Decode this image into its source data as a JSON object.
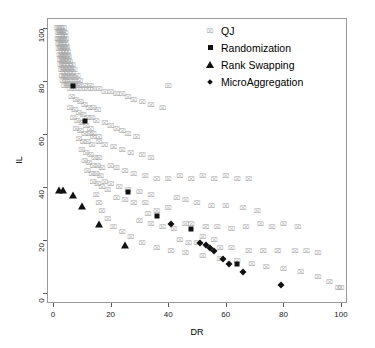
{
  "chart_data": {
    "type": "scatter",
    "title": "",
    "xlabel": "DR",
    "ylabel": "IL",
    "xlim": [
      0,
      100
    ],
    "ylim": [
      0,
      100
    ],
    "xticks": [
      0,
      20,
      40,
      60,
      80,
      100
    ],
    "yticks": [
      0,
      20,
      40,
      60,
      80,
      100
    ],
    "grid": false,
    "legend_position": "top-right",
    "series": [
      {
        "name": "QJ",
        "marker": "cross-box",
        "color": "#a8a8a8",
        "points": [
          [
            1.5,
            100
          ],
          [
            2.0,
            100
          ],
          [
            2.4,
            99
          ],
          [
            2.8,
            100
          ],
          [
            3.2,
            99
          ],
          [
            3.6,
            100
          ],
          [
            1.8,
            98
          ],
          [
            2.2,
            98
          ],
          [
            2.6,
            98
          ],
          [
            3.0,
            97
          ],
          [
            3.4,
            98
          ],
          [
            3.8,
            97
          ],
          [
            4.2,
            98
          ],
          [
            1.6,
            96
          ],
          [
            2.0,
            96
          ],
          [
            2.5,
            96
          ],
          [
            3.0,
            95
          ],
          [
            3.5,
            96
          ],
          [
            4.0,
            95
          ],
          [
            4.4,
            96
          ],
          [
            1.9,
            94
          ],
          [
            2.3,
            94
          ],
          [
            2.8,
            93
          ],
          [
            3.3,
            94
          ],
          [
            3.8,
            93
          ],
          [
            4.3,
            94
          ],
          [
            4.8,
            93
          ],
          [
            2.1,
            92
          ],
          [
            2.6,
            92
          ],
          [
            3.1,
            91
          ],
          [
            3.6,
            92
          ],
          [
            4.1,
            91
          ],
          [
            4.6,
            92
          ],
          [
            5.1,
            91
          ],
          [
            2.3,
            90
          ],
          [
            2.8,
            90
          ],
          [
            3.3,
            89
          ],
          [
            3.8,
            90
          ],
          [
            4.3,
            89
          ],
          [
            4.9,
            90
          ],
          [
            5.4,
            89
          ],
          [
            2.5,
            88
          ],
          [
            3.0,
            88
          ],
          [
            3.5,
            87
          ],
          [
            4.0,
            88
          ],
          [
            4.6,
            87
          ],
          [
            5.2,
            88
          ],
          [
            5.8,
            87
          ],
          [
            2.7,
            86
          ],
          [
            3.2,
            86
          ],
          [
            3.8,
            85
          ],
          [
            4.4,
            86
          ],
          [
            5.0,
            85
          ],
          [
            5.6,
            86
          ],
          [
            6.2,
            85
          ],
          [
            6.8,
            86
          ],
          [
            2.9,
            84
          ],
          [
            3.5,
            84
          ],
          [
            4.1,
            83
          ],
          [
            4.7,
            84
          ],
          [
            5.3,
            83
          ],
          [
            6.0,
            84
          ],
          [
            6.7,
            83
          ],
          [
            7.4,
            84
          ],
          [
            3.1,
            82
          ],
          [
            3.8,
            82
          ],
          [
            4.5,
            81
          ],
          [
            5.2,
            82
          ],
          [
            6.0,
            81
          ],
          [
            6.8,
            82
          ],
          [
            7.6,
            81
          ],
          [
            8.4,
            82
          ],
          [
            3.4,
            80
          ],
          [
            4.2,
            80
          ],
          [
            5.0,
            79
          ],
          [
            5.8,
            80
          ],
          [
            6.6,
            79
          ],
          [
            7.5,
            80
          ],
          [
            8.4,
            79
          ],
          [
            9.3,
            80
          ],
          [
            4.0,
            78
          ],
          [
            5.0,
            78
          ],
          [
            6.0,
            77
          ],
          [
            7.0,
            78
          ],
          [
            8.0,
            77
          ],
          [
            9.0,
            78
          ],
          [
            10.0,
            77
          ],
          [
            11.0,
            78
          ],
          [
            12.0,
            77
          ],
          [
            13.0,
            78
          ],
          [
            14.0,
            77
          ],
          [
            16.0,
            77
          ],
          [
            18.0,
            76
          ],
          [
            20.0,
            76
          ],
          [
            22.0,
            75
          ],
          [
            24.0,
            75
          ],
          [
            26.0,
            74
          ],
          [
            28.0,
            73
          ],
          [
            31.0,
            72
          ],
          [
            34.0,
            71
          ],
          [
            38.0,
            70
          ],
          [
            40.0,
            78
          ],
          [
            6.5,
            74
          ],
          [
            8.0,
            73
          ],
          [
            9.5,
            72
          ],
          [
            11.0,
            71
          ],
          [
            12.5,
            70
          ],
          [
            14.0,
            70
          ],
          [
            15.5,
            69
          ],
          [
            6.0,
            70
          ],
          [
            7.5,
            69
          ],
          [
            9.0,
            68
          ],
          [
            10.5,
            67
          ],
          [
            12.0,
            66
          ],
          [
            13.5,
            66
          ],
          [
            15.0,
            65
          ],
          [
            7.0,
            66
          ],
          [
            8.5,
            65
          ],
          [
            10.0,
            64
          ],
          [
            11.5,
            63
          ],
          [
            13.0,
            62
          ],
          [
            8.0,
            62
          ],
          [
            9.5,
            61
          ],
          [
            11.0,
            60
          ],
          [
            12.5,
            60
          ],
          [
            14.0,
            59
          ],
          [
            9.0,
            58
          ],
          [
            10.5,
            57
          ],
          [
            12.0,
            57
          ],
          [
            13.5,
            56
          ],
          [
            18.0,
            64
          ],
          [
            20.0,
            63
          ],
          [
            22.0,
            62
          ],
          [
            24.0,
            61
          ],
          [
            26.0,
            60
          ],
          [
            29.0,
            59
          ],
          [
            16.0,
            57
          ],
          [
            18.0,
            56
          ],
          [
            21.0,
            55
          ],
          [
            24.0,
            54
          ],
          [
            27.0,
            53
          ],
          [
            31.0,
            52
          ],
          [
            34.0,
            51
          ],
          [
            10.0,
            54
          ],
          [
            11.5,
            53
          ],
          [
            13.0,
            52
          ],
          [
            14.5,
            51
          ],
          [
            16.0,
            51
          ],
          [
            11.0,
            50
          ],
          [
            12.5,
            49
          ],
          [
            14.0,
            48
          ],
          [
            15.5,
            48
          ],
          [
            17.0,
            47
          ],
          [
            12.0,
            46
          ],
          [
            13.5,
            45
          ],
          [
            15.0,
            45
          ],
          [
            16.5,
            44
          ],
          [
            20.0,
            48
          ],
          [
            22.0,
            47
          ],
          [
            25.0,
            46
          ],
          [
            28.0,
            45
          ],
          [
            32.0,
            44
          ],
          [
            36.0,
            43
          ],
          [
            40.0,
            43
          ],
          [
            44.0,
            44
          ],
          [
            48.0,
            43
          ],
          [
            52.0,
            44
          ],
          [
            56.0,
            43
          ],
          [
            60.0,
            44
          ],
          [
            64.0,
            43
          ],
          [
            68.0,
            43
          ],
          [
            18.0,
            42
          ],
          [
            20.0,
            41
          ],
          [
            23.0,
            40
          ],
          [
            26.0,
            39
          ],
          [
            30.0,
            38
          ],
          [
            34.0,
            37
          ],
          [
            14.0,
            42
          ],
          [
            15.5,
            41
          ],
          [
            17.0,
            40
          ],
          [
            19.0,
            39
          ],
          [
            43.0,
            36
          ],
          [
            46.0,
            35
          ],
          [
            50.0,
            34
          ],
          [
            55.0,
            33
          ],
          [
            60.0,
            33
          ],
          [
            66.0,
            32
          ],
          [
            71.0,
            31
          ],
          [
            40.0,
            32
          ],
          [
            36.0,
            31
          ],
          [
            33.0,
            30
          ],
          [
            46.0,
            26
          ],
          [
            48.0,
            26
          ],
          [
            53.0,
            25
          ],
          [
            57.0,
            25
          ],
          [
            62.0,
            24
          ],
          [
            67.0,
            25
          ],
          [
            72.0,
            26
          ],
          [
            76.0,
            25
          ],
          [
            80.0,
            26
          ],
          [
            85.0,
            25
          ],
          [
            30.0,
            27
          ],
          [
            34.0,
            26
          ],
          [
            38.0,
            25
          ],
          [
            42.0,
            24
          ],
          [
            52.0,
            21
          ],
          [
            56.0,
            20
          ],
          [
            44.0,
            20
          ],
          [
            47.0,
            19
          ],
          [
            50.0,
            19
          ],
          [
            58.0,
            17
          ],
          [
            62.0,
            17
          ],
          [
            68.0,
            16
          ],
          [
            73.0,
            16
          ],
          [
            78.0,
            16
          ],
          [
            84.0,
            16
          ],
          [
            88.0,
            16
          ],
          [
            92.0,
            15
          ],
          [
            74.0,
            10
          ],
          [
            80.0,
            9
          ],
          [
            86.0,
            8
          ],
          [
            92.0,
            6
          ],
          [
            96.0,
            4
          ],
          [
            99.0,
            2
          ],
          [
            100.0,
            2
          ],
          [
            64.0,
            12
          ],
          [
            69.0,
            11
          ],
          [
            58.0,
            13
          ],
          [
            52.0,
            14
          ],
          [
            46.0,
            15
          ],
          [
            41.0,
            16
          ],
          [
            36.0,
            17
          ],
          [
            31.0,
            19
          ],
          [
            27.0,
            21
          ],
          [
            24.0,
            23
          ],
          [
            21.0,
            25
          ],
          [
            19.0,
            28
          ],
          [
            17.0,
            31
          ],
          [
            16.0,
            34
          ],
          [
            15.0,
            37
          ],
          [
            22.0,
            36
          ],
          [
            25.0,
            35
          ],
          [
            28.0,
            34
          ],
          [
            32.0,
            34
          ],
          [
            14.0,
            60
          ],
          [
            16.0,
            59
          ]
        ]
      },
      {
        "name": "Randomization",
        "marker": "square",
        "color": "#111111",
        "points": [
          [
            7,
            78
          ],
          [
            11,
            65
          ],
          [
            26,
            38
          ],
          [
            36,
            29
          ],
          [
            48,
            24
          ],
          [
            64,
            11
          ]
        ]
      },
      {
        "name": "Rank Swapping",
        "marker": "triangle",
        "color": "#111111",
        "points": [
          [
            2,
            39
          ],
          [
            3.5,
            39
          ],
          [
            7,
            37
          ],
          [
            10,
            33
          ],
          [
            16,
            26
          ],
          [
            25,
            18
          ]
        ]
      },
      {
        "name": "MicroAggregation",
        "marker": "diamond",
        "color": "#111111",
        "points": [
          [
            41,
            26
          ],
          [
            51,
            19
          ],
          [
            53,
            18
          ],
          [
            54.5,
            17
          ],
          [
            56,
            16
          ],
          [
            59,
            13
          ],
          [
            61,
            11
          ],
          [
            66,
            8
          ],
          [
            79,
            3
          ]
        ]
      }
    ]
  },
  "legend": {
    "items": [
      {
        "label": "QJ",
        "marker": "cross-box"
      },
      {
        "label": "Randomization",
        "marker": "square"
      },
      {
        "label": "Rank Swapping",
        "marker": "triangle"
      },
      {
        "label": "MicroAggregation",
        "marker": "diamond"
      }
    ]
  }
}
